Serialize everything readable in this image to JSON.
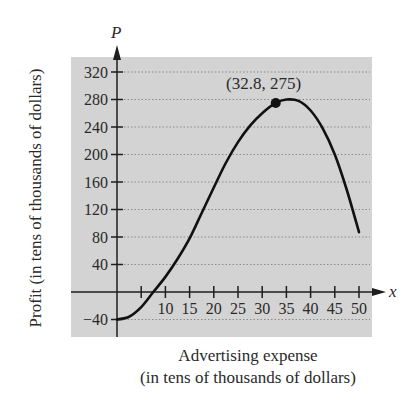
{
  "chart_data": {
    "type": "line",
    "title": "",
    "xlabel": "Advertising expense (in tens of thousands of dollars)",
    "ylabel": "Profit (in tens of thousands of dollars)",
    "x_axis_var": "x",
    "y_axis_var": "P",
    "xlim": [
      0,
      52
    ],
    "ylim": [
      -50,
      335
    ],
    "x_ticks": [
      5,
      10,
      15,
      20,
      25,
      30,
      35,
      40,
      45,
      50
    ],
    "x_tick_labels": [
      "10",
      "15",
      "20",
      "25",
      "30",
      "35",
      "40",
      "45",
      "50"
    ],
    "y_ticks": [
      -40,
      40,
      80,
      120,
      160,
      200,
      240,
      280,
      320
    ],
    "grid": "horizontal dotted",
    "series": [
      {
        "name": "P",
        "x": [
          0,
          2.5,
          5,
          7.5,
          10,
          12.5,
          15,
          17.5,
          20,
          22.5,
          25,
          27.5,
          30,
          32.8,
          35,
          37.5,
          40,
          42.5,
          45,
          47.5,
          50
        ],
        "values": [
          -40,
          -36,
          -22,
          0,
          22,
          48,
          78,
          115,
          152,
          188,
          218,
          242,
          260,
          275,
          280,
          278,
          264,
          238,
          200,
          148,
          87
        ]
      }
    ],
    "annotations": [
      {
        "x": 32.8,
        "y": 275,
        "label": "(32.8, 275)",
        "marker": "filled-circle"
      }
    ]
  },
  "labels": {
    "y_var": "P",
    "x_var": "x",
    "ylabel": "Profit (in tens of thousands of dollars)",
    "xlabel_line1": "Advertising expense",
    "xlabel_line2": "(in tens of thousands of dollars)",
    "point_label": "(32.8, 275)"
  },
  "colors": {
    "panel": "#d3d3d3",
    "grid": "#8a8a8a",
    "axis": "#1e1e1e",
    "curve": "#111111"
  }
}
